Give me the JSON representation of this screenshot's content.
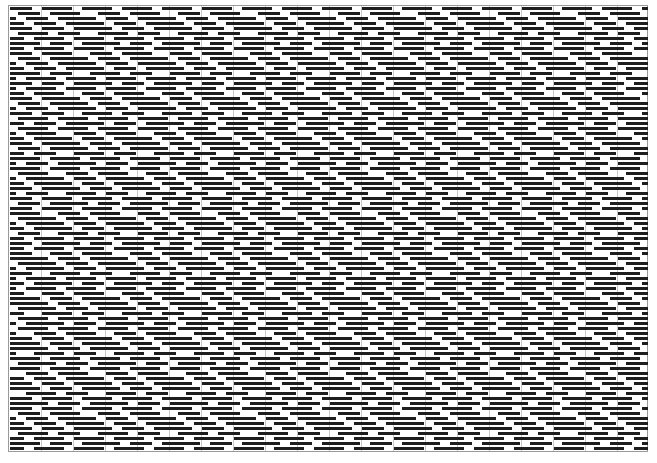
{
  "figure": {
    "type": "weave-drawdown",
    "columns": 160,
    "rows": 89,
    "cell_width_px": 4,
    "row_height_px": 5,
    "colors": {
      "filled": "#1e1e1e",
      "background": "#ffffff",
      "border": "#9a9a9a",
      "guides": "#c8c8c8"
    },
    "guide_every_columns": 8,
    "pattern_repeat": [
      "11111100111111110011",
      "00111111001111111100",
      "11001111110011111111",
      "11110011111100111111",
      "11111100111111001111",
      "00111111110011111100",
      "11110011111111001111",
      "11111111001111110011"
    ]
  }
}
